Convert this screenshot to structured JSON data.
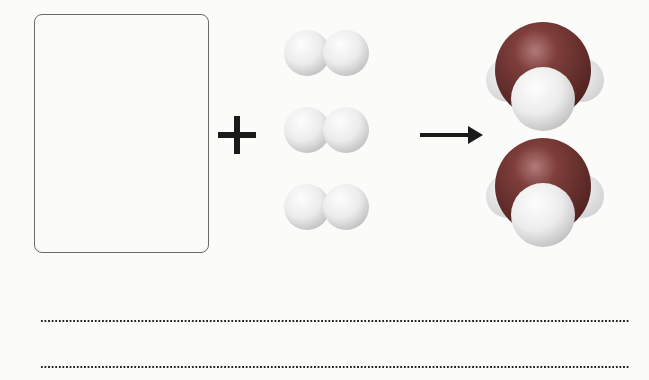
{
  "diagram": {
    "type": "chemical-reaction",
    "reactant_box": {
      "content": "",
      "description": "empty box for missing reactant"
    },
    "operator": "+",
    "reactant_molecules": {
      "name": "H2",
      "count": 3,
      "atom_color": "#e8e8e8"
    },
    "arrow": "→",
    "product_molecules": {
      "name": "H2O",
      "count": 2,
      "oxygen_color": "#7a3a38",
      "hydrogen_color": "#ececec"
    },
    "answer_lines": [
      {
        "text": ""
      },
      {
        "text": ""
      }
    ]
  }
}
